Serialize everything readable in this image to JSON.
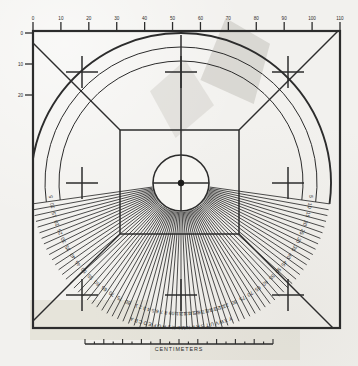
{
  "document": {
    "kind": "scanned technical calibration chart",
    "title": "Radial protractor / centimeter calibration chart",
    "background_color": "#f2f1ee",
    "ink_color": "#2c2c2c"
  },
  "scale_bar": {
    "label": "CENTIMETERS",
    "major_tick_count": 11,
    "minor_ticks_per_major": 2,
    "x_start": 85,
    "x_end": 273,
    "y": 344
  },
  "frame": {
    "x": 33,
    "y": 31,
    "width": 307,
    "height": 297,
    "stroke_width": 2.2
  },
  "top_axis": {
    "tick_labels": [
      "0",
      "10",
      "20",
      "30",
      "40",
      "50",
      "60",
      "70",
      "80",
      "90",
      "100",
      "110"
    ],
    "tick_count": 12
  },
  "left_axis": {
    "tick_labels": [
      "0",
      "10",
      "20"
    ],
    "tick_count": 3
  },
  "center": {
    "cx": 181,
    "cy": 183,
    "hub_radius": 3.2,
    "disc_radius": 28
  },
  "inner_square": {
    "x": 120,
    "y": 130,
    "width": 119,
    "height": 104
  },
  "radial_fan": {
    "spoke_count": 72,
    "start_angle_deg": 188,
    "end_angle_deg": 352,
    "inner_radius": 29,
    "outer_radius": 150
  },
  "arcs": [
    {
      "name": "outer-arc",
      "radius": 150
    },
    {
      "name": "label-arc-inner",
      "radius": 122
    },
    {
      "name": "label-arc-outer",
      "radius": 136
    }
  ],
  "degree_labels_left": [
    "5",
    "10",
    "15",
    "20",
    "25",
    "30",
    "35",
    "40",
    "45",
    "50",
    "55",
    "60",
    "65",
    "70",
    "75",
    "80"
  ],
  "degree_labels_right": [
    "5",
    "10",
    "15",
    "20",
    "25",
    "30",
    "35",
    "40",
    "45",
    "50",
    "55",
    "60",
    "65",
    "70",
    "75",
    "80"
  ],
  "bottom_arc_labels_outer": [
    "A",
    "B",
    "C",
    "D",
    "E",
    "F",
    "G",
    "H",
    "J",
    "K",
    "L",
    "M",
    "N",
    "P",
    "R",
    "S",
    "T",
    "U",
    "V",
    "W",
    "X",
    "Y"
  ],
  "bottom_arc_labels_inner": [
    "1",
    "2",
    "3",
    "4",
    "5",
    "6",
    "7",
    "8",
    "9",
    "10",
    "11",
    "12",
    "13",
    "14",
    "15",
    "16",
    "17",
    "18",
    "19",
    "20",
    "21",
    "22"
  ],
  "corner_crosshairs": [
    {
      "name": "crosshair-top-left",
      "x": 82,
      "y": 72
    },
    {
      "name": "crosshair-top-center",
      "x": 181,
      "y": 72
    },
    {
      "name": "crosshair-top-right",
      "x": 288,
      "y": 72
    },
    {
      "name": "crosshair-mid-left",
      "x": 82,
      "y": 183
    },
    {
      "name": "crosshair-mid-right",
      "x": 288,
      "y": 183
    },
    {
      "name": "crosshair-bottom-left",
      "x": 82,
      "y": 295
    },
    {
      "name": "crosshair-bottom-center",
      "x": 181,
      "y": 295
    },
    {
      "name": "crosshair-bottom-right",
      "x": 288,
      "y": 295
    }
  ]
}
